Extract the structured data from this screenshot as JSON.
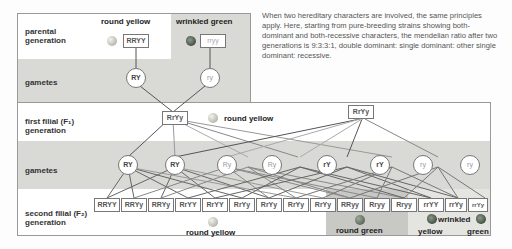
{
  "description": "When two hereditary characters are involved, the same principles apply. Here, starting from pure-breeding strains showing both-dominant and both-recessive characters, the mendelian ratio after two generations is 9:3:3:1, double dominant: single dominant: other single dominant: recessive.",
  "rows": {
    "parental": "parental generation",
    "gametes_1": "gametes",
    "f1": "first filial (F₁) generation",
    "gametes_2": "gametes",
    "f2": "second filial (F₂) generation"
  },
  "parental": {
    "left": {
      "phenotype": "round yellow",
      "genotype": "RRYY",
      "pea": "yellow-round-pea-icon"
    },
    "right": {
      "phenotype": "wrinkled green",
      "genotype": "rryy",
      "pea": "green-wrinkled-pea-icon"
    }
  },
  "gametes_1": [
    "RY",
    "ry"
  ],
  "f1": {
    "left_genotype": "RrYy",
    "right_genotype": "RrYy",
    "phenotype": "round yellow"
  },
  "gametes_2": [
    "RY",
    "RY",
    "Ry",
    "Ry",
    "rY",
    "rY",
    "ry",
    "ry"
  ],
  "f2": {
    "genotypes": [
      "RRYY",
      "RRYy",
      "RRYy",
      "RrYY",
      "RrYY",
      "RrYy",
      "RrYy",
      "RrYy",
      "RrYy",
      "RRyy",
      "Rryy",
      "Rryy",
      "rrYY",
      "rrYy",
      "rrYy",
      "rryy"
    ],
    "phenotypes": {
      "round_yellow": "round yellow",
      "round_green": "round green",
      "wrinkled": "wrinkled",
      "wrinkled_yellow": "yellow",
      "wrinkled_green": "green"
    }
  },
  "colors": {
    "panel_white": "#ffffff",
    "panel_gray": "#d9d9d6",
    "round_green_bg": "#c8c8c4",
    "wrinkled_bg": "#e2e2df",
    "line": "#555555"
  }
}
